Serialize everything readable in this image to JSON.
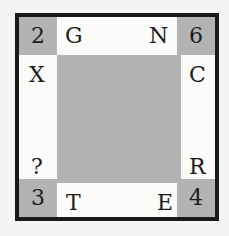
{
  "puzzle": {
    "corners": {
      "top_left": "2",
      "top_right": "6",
      "bottom_left": "3",
      "bottom_right": "4"
    },
    "edges": {
      "top_left": "G",
      "top_right": "N",
      "left_top": "X",
      "left_bottom": "?",
      "right_top": "C",
      "right_bottom": "R",
      "bottom_left": "T",
      "bottom_right": "E"
    },
    "colors": {
      "corner_fill": "#b3b3b3",
      "center_fill": "#b3b3b3",
      "border": "#1a1a1a",
      "background": "#fbfbf9"
    }
  }
}
